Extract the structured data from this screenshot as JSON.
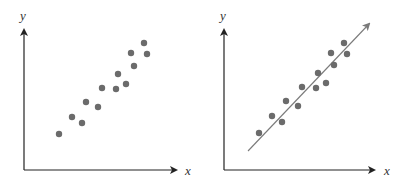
{
  "chart_data": [
    {
      "type": "scatter",
      "title": "",
      "xlabel": "x",
      "ylabel": "y",
      "grid": false,
      "trend_line": false,
      "points": [
        [
          59,
          134
        ],
        [
          72,
          117
        ],
        [
          82,
          123
        ],
        [
          86,
          102
        ],
        [
          98,
          107
        ],
        [
          102,
          88
        ],
        [
          116,
          89
        ],
        [
          118,
          74
        ],
        [
          126,
          84
        ],
        [
          131,
          53
        ],
        [
          134,
          66
        ],
        [
          144,
          43
        ],
        [
          147,
          54
        ]
      ]
    },
    {
      "type": "scatter",
      "title": "",
      "xlabel": "x",
      "ylabel": "y",
      "grid": false,
      "trend_line": true,
      "trend_line_endpoints": [
        [
          248,
          151
        ],
        [
          369,
          24
        ]
      ],
      "points": [
        [
          259,
          133
        ],
        [
          272,
          116
        ],
        [
          282,
          122
        ],
        [
          286,
          101
        ],
        [
          298,
          106
        ],
        [
          302,
          87
        ],
        [
          316,
          88
        ],
        [
          318,
          73
        ],
        [
          326,
          83
        ],
        [
          331,
          53
        ],
        [
          334,
          65
        ],
        [
          344,
          43
        ],
        [
          347,
          54
        ]
      ]
    }
  ],
  "colors": {
    "point": "#6b6b6b",
    "axis": "#222222",
    "trend": "#7a7a7a"
  },
  "labels": {
    "left_x": "x",
    "left_y": "y",
    "right_x": "x",
    "right_y": "y"
  }
}
